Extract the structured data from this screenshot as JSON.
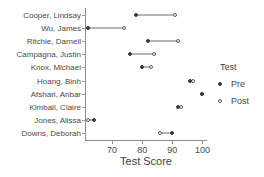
{
  "chart_data": {
    "type": "scatter",
    "title": "",
    "xlabel": "Test Score",
    "ylabel": "",
    "xlim": [
      61,
      101.5
    ],
    "xticks": [
      70,
      80,
      90,
      100
    ],
    "xtick_labels": [
      "70",
      "80",
      "90",
      "100"
    ],
    "grid": false,
    "legend_position": "right",
    "legend": {
      "title": "Test",
      "entries": [
        {
          "name": "Pre",
          "marker": "filled-circle",
          "color": "#3b3b3b"
        },
        {
          "name": "Post",
          "marker": "open-circle",
          "color": "#5a5a5a"
        }
      ]
    },
    "categories": [
      "Cooper, Lindsay",
      "Wu, James",
      "Ritchie, Darnell",
      "Campagna, Justin",
      "Knox, Michael",
      "Hoang, Binh",
      "Afshari, Anbar",
      "Kimball, Claire",
      "Jones, Alissa",
      "Downs, Deborah"
    ],
    "series": [
      {
        "name": "Pre",
        "values": [
          78,
          62,
          82,
          76,
          80,
          96,
          100,
          92,
          64,
          90
        ]
      },
      {
        "name": "Post",
        "values": [
          91,
          74,
          92,
          84,
          83,
          97,
          100,
          93,
          62,
          86
        ]
      }
    ]
  }
}
